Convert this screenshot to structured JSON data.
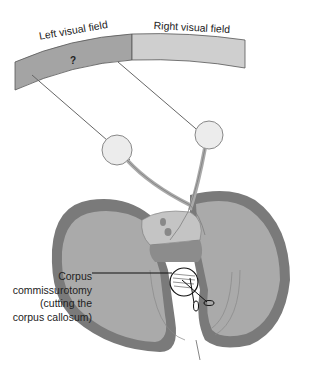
{
  "diagram": {
    "type": "split-brain visual pathway illustration",
    "labels": {
      "left_visual_field": "Left visual field",
      "right_visual_field": "Right visual field",
      "unknown_marker": "?",
      "callout_line1": "Corpus",
      "callout_line2": "commissurotomy",
      "callout_line3": "(cutting the",
      "callout_line4": "corpus callosum)"
    },
    "colors": {
      "left_field": "#a4a4a4",
      "right_field": "#cfcfcf",
      "cortex_outer": "#7a7a7a",
      "cortex_inner": "#a9a9a9",
      "eye": "#ececec",
      "line": "#555555"
    }
  }
}
